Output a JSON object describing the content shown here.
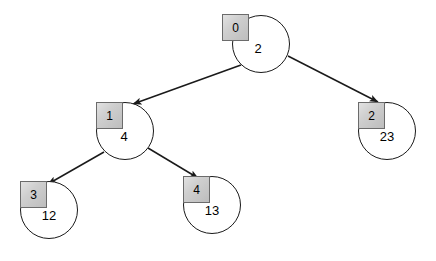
{
  "diagram": {
    "type": "tree",
    "background_color": "#ffffff",
    "node_fill_color": "#ffffff",
    "node_stroke_color": "#1a1a1a",
    "index_box_fill_color": "#cfcfcf",
    "index_box_stroke_color": "#6b6b6b",
    "edge_color": "#1a1a1a",
    "nodes": [
      {
        "index": "0",
        "value": "2",
        "circle": {
          "cx": 261,
          "cy": 44,
          "r": 29
        },
        "box": {
          "x": 222,
          "y": 14,
          "w": 27,
          "h": 27
        },
        "value_pos": {
          "x": 258,
          "y": 49
        }
      },
      {
        "index": "1",
        "value": "4",
        "circle": {
          "cx": 125,
          "cy": 131,
          "r": 29
        },
        "box": {
          "x": 96,
          "y": 102,
          "w": 27,
          "h": 27
        },
        "value_pos": {
          "x": 124,
          "y": 137
        }
      },
      {
        "index": "2",
        "value": "23",
        "circle": {
          "cx": 387,
          "cy": 131,
          "r": 29
        },
        "box": {
          "x": 358,
          "y": 102,
          "w": 27,
          "h": 27
        },
        "value_pos": {
          "x": 387,
          "y": 137
        }
      },
      {
        "index": "3",
        "value": "12",
        "circle": {
          "cx": 49,
          "cy": 210,
          "r": 29
        },
        "box": {
          "x": 20,
          "y": 181,
          "w": 27,
          "h": 27
        },
        "value_pos": {
          "x": 49,
          "y": 216
        }
      },
      {
        "index": "4",
        "value": "13",
        "circle": {
          "cx": 212,
          "cy": 205,
          "r": 29
        },
        "box": {
          "x": 183,
          "y": 176,
          "w": 27,
          "h": 27
        },
        "value_pos": {
          "x": 212,
          "y": 211
        }
      }
    ],
    "edges": [
      {
        "from": "0",
        "to": "1",
        "x1": 241,
        "y1": 65,
        "x2": 133,
        "y2": 104
      },
      {
        "from": "0",
        "to": "2",
        "x1": 288,
        "y1": 56,
        "x2": 378,
        "y2": 102
      },
      {
        "from": "1",
        "to": "3",
        "x1": 104,
        "y1": 152,
        "x2": 48,
        "y2": 184
      },
      {
        "from": "1",
        "to": "4",
        "x1": 148,
        "y1": 148,
        "x2": 198,
        "y2": 178
      }
    ]
  }
}
